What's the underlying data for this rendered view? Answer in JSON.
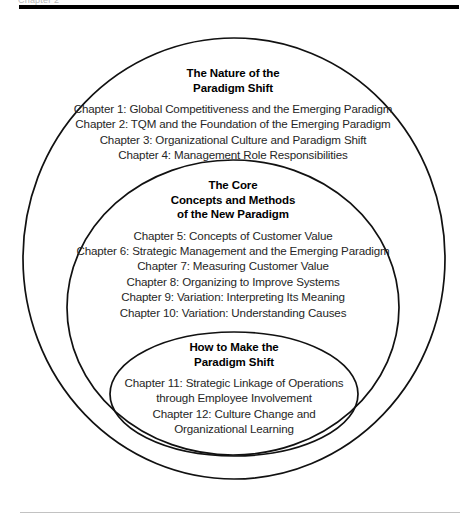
{
  "figure": {
    "top_clipped_text": "Chapter 2",
    "rules": {
      "top_rule_color": "#000000",
      "bottom_rule_color": "#c2c2c2"
    },
    "ellipse_stroke_color": "#111111",
    "background_color": "#ffffff"
  },
  "outer": {
    "heading_lines": [
      "The Nature of the",
      "Paradigm Shift"
    ],
    "chapters": [
      "Chapter 1: Global Competitiveness and the Emerging Paradigm",
      "Chapter 2: TQM and the Foundation of the Emerging Paradigm",
      "Chapter 3: Organizational Culture and Paradigm Shift",
      "Chapter 4: Management Role Responsibilities"
    ]
  },
  "middle": {
    "heading_lines": [
      "The Core",
      "Concepts and Methods",
      "of the New Paradigm"
    ],
    "chapters": [
      "Chapter 5: Concepts of Customer Value",
      "Chapter 6: Strategic Management and the Emerging Paradigm",
      "Chapter 7: Measuring Customer Value",
      "Chapter 8: Organizing to Improve Systems",
      "Chapter 9: Variation: Interpreting Its Meaning",
      "Chapter 10: Variation: Understanding Causes"
    ]
  },
  "inner": {
    "heading_lines": [
      "How to Make the",
      "Paradigm Shift"
    ],
    "chapters": [
      "Chapter 11: Strategic Linkage of Operations",
      "through Employee Involvement",
      "Chapter 12: Culture Change and",
      "Organizational Learning"
    ]
  }
}
